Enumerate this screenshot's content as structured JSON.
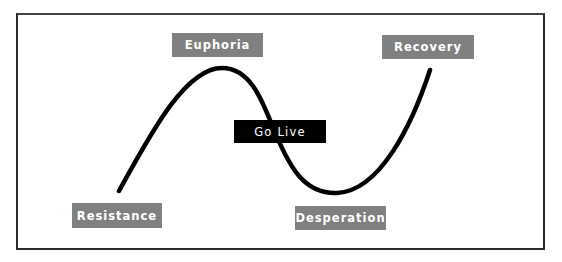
{
  "diagram": {
    "type": "change-curve",
    "stages": [
      {
        "id": "resistance",
        "label": "Resistance"
      },
      {
        "id": "euphoria",
        "label": "Euphoria"
      },
      {
        "id": "go_live",
        "label": "Go Live"
      },
      {
        "id": "desperation",
        "label": "Desperation"
      },
      {
        "id": "recovery",
        "label": "Recovery"
      }
    ],
    "colors": {
      "stage_box": "#808080",
      "milestone_box": "#000000",
      "curve": "#000000",
      "frame": "#2a2a2a"
    }
  }
}
